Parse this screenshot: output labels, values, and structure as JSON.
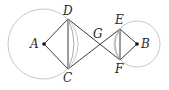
{
  "diagram": {
    "type": "geometry",
    "circles": [
      {
        "center": "A",
        "cx": 43,
        "cy": 44,
        "r": 35,
        "stroke": "#c8c8c8"
      },
      {
        "center": "B",
        "cx": 137,
        "cy": 44,
        "r": 23,
        "stroke": "#c8c8c8"
      }
    ],
    "points": {
      "A": {
        "x": 44,
        "y": 44,
        "label": "A"
      },
      "B": {
        "x": 137,
        "y": 44,
        "label": "B"
      },
      "C": {
        "x": 68,
        "y": 69,
        "label": "C"
      },
      "D": {
        "x": 68,
        "y": 19,
        "label": "D"
      },
      "E": {
        "x": 120,
        "y": 29,
        "label": "E"
      },
      "F": {
        "x": 120,
        "y": 60,
        "label": "F"
      },
      "G": {
        "x": 98,
        "y": 44,
        "label": "G"
      }
    },
    "segments": [
      "AD",
      "AC",
      "DC",
      "DF",
      "CE",
      "EF",
      "EB",
      "FB"
    ],
    "arcs": [
      "DC inner arc",
      "EF inner arc"
    ],
    "line_color": "#3a3a3a"
  }
}
